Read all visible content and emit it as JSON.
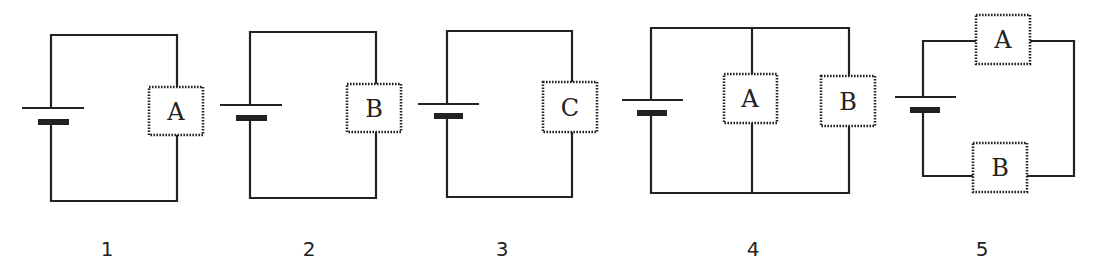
{
  "diagram": {
    "type": "circuit-diagrams",
    "colors": {
      "ink": "#222222",
      "background": "#ffffff"
    },
    "circuits": [
      {
        "number": "1",
        "config": "single",
        "bulbs": [
          {
            "label": "A"
          }
        ]
      },
      {
        "number": "2",
        "config": "single",
        "bulbs": [
          {
            "label": "B"
          }
        ]
      },
      {
        "number": "3",
        "config": "single",
        "bulbs": [
          {
            "label": "C"
          }
        ]
      },
      {
        "number": "4",
        "config": "parallel",
        "bulbs": [
          {
            "label": "A"
          },
          {
            "label": "B"
          }
        ]
      },
      {
        "number": "5",
        "config": "series",
        "bulbs": [
          {
            "label": "A"
          },
          {
            "label": "B"
          }
        ]
      }
    ],
    "components": {
      "battery_icon": "battery-icon",
      "bulb_icon": "bulb-icon"
    }
  }
}
